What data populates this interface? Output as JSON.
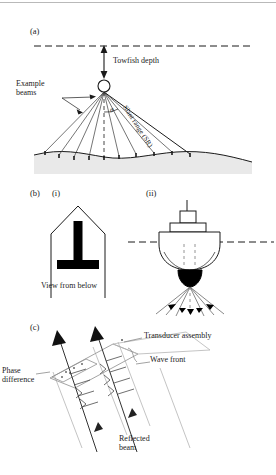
{
  "figure": {
    "background": "#ffffff",
    "ink": "#1a1a1a",
    "seabed_fill": "#e8e8e8",
    "panels": [
      {
        "id": "a",
        "label": "(a)",
        "name": "side-scan-towfish-geometry",
        "labels": {
          "towfish_depth": "Towfish depth",
          "example_beams": "Example\nbeams",
          "slant_range": "Slant range (SR)",
          "angle_symbol": "θ"
        },
        "elements": {
          "sea_surface": "dashed-water-line",
          "towfish": "circle-towfish",
          "nadir": "vertical-dashed-nadir-line",
          "beam_count": 9,
          "seabed": "curved-seabed-profile"
        }
      },
      {
        "id": "b",
        "label": "(b)",
        "name": "multibeam-transducer-and-vessel",
        "sub": [
          {
            "id": "i",
            "label": "(i)",
            "name": "hull-view-from-below",
            "caption": "View from below",
            "elements": {
              "hull": "hull-outline-pointed-bow",
              "array": "mills-cross-t-shaped-transducer-array"
            }
          },
          {
            "id": "ii",
            "label": "(ii)",
            "name": "vessel-beam-fan-section",
            "elements": {
              "sea_surface": "dashed-water-line",
              "vessel": "ship-hull-with-superstructure-and-mast",
              "transducer": "hull-mounted-transducer",
              "beam_fan": "downward-beam-fan-with-arrows",
              "nadir": "vertical-dashed-nadir-line"
            }
          }
        ]
      },
      {
        "id": "c",
        "label": "(c)",
        "name": "interferometric-phase-difference-detail",
        "labels": {
          "transducer_assembly": "Transducer assembly",
          "wave_front": "Wave front",
          "phase_difference": "Phase\ndifference",
          "reflected_beam": "Reflected\nbeam"
        },
        "elements": {
          "assembly_plane": "tilted-transducer-plane",
          "wave_fronts": "tick-marked-wavefront-lines",
          "beams": "two-upward-arrow-ray-paths",
          "phase_patch": "small-parallelogram-phase-region"
        }
      }
    ]
  }
}
